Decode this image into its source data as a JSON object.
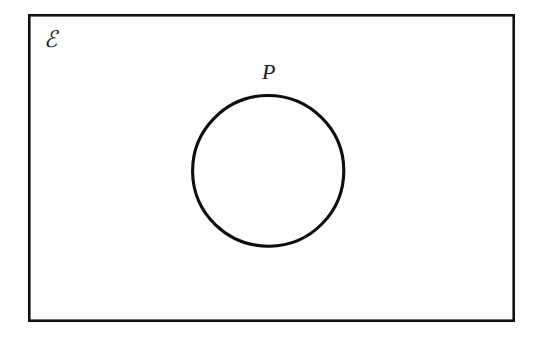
{
  "figure": {
    "type": "venn-diagram",
    "background_color": "#ffffff",
    "ink_color": "#111111"
  },
  "universal_set": {
    "label": "ℰ",
    "label_name": "script-capital-e",
    "meaning": "universal set",
    "shape": "rectangle",
    "x": 28,
    "y": 14,
    "width": 487,
    "height": 308,
    "stroke_width": 2.6,
    "label_x": 44,
    "label_y": 26
  },
  "sets": [
    {
      "label": "P",
      "shape": "circle",
      "center_x": 268,
      "center_y": 171,
      "radius": 75,
      "stroke_width": 3.1,
      "label_x": 262,
      "label_y": 59,
      "fill": "none"
    }
  ],
  "labels": {
    "set_p": "P",
    "universal": "ℰ"
  }
}
